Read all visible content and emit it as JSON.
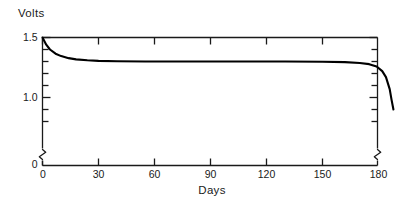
{
  "chart_data": {
    "type": "line",
    "title": "",
    "subtitle": "",
    "xlabel": "Days",
    "ylabel": "Volts",
    "grid": false,
    "legend": null,
    "legend_position": "none",
    "xlim": [
      0,
      195
    ],
    "ylim": [
      0.8,
      1.5
    ],
    "y_axis_break": true,
    "y_break_note": "axis broken between 0 and 0.8; origin labeled 0",
    "xticks": [
      0,
      30,
      60,
      90,
      120,
      150,
      180
    ],
    "xtick_labels": [
      "0",
      "30",
      "60",
      "90",
      "120",
      "150",
      "180"
    ],
    "yticks": [
      1.5,
      1.0
    ],
    "ytick_labels": [
      "1.5",
      "1.0"
    ],
    "y_minor_ticks": [
      1.4,
      1.3,
      1.2,
      1.1,
      0.9,
      0.8
    ],
    "y_origin_label": "0",
    "x_origin_label": "0",
    "series": [
      {
        "name": "Cell voltage",
        "color": "#000000",
        "x": [
          0,
          2,
          4,
          7,
          10,
          14,
          18,
          24,
          30,
          40,
          55,
          70,
          90,
          110,
          130,
          150,
          162,
          170,
          175,
          179,
          182,
          184,
          186,
          187,
          188
        ],
        "y": [
          1.5,
          1.44,
          1.4,
          1.365,
          1.345,
          1.328,
          1.318,
          1.31,
          1.305,
          1.302,
          1.3,
          1.3,
          1.3,
          1.3,
          1.3,
          1.298,
          1.295,
          1.288,
          1.278,
          1.258,
          1.22,
          1.17,
          1.07,
          0.98,
          0.9
        ]
      }
    ]
  },
  "labels": {
    "y_axis_title": "Volts",
    "x_axis_title": "Days"
  },
  "colors": {
    "line": "#000000",
    "axis": "#1a1a1a",
    "background": "#ffffff",
    "text": "#1a1a1a"
  }
}
